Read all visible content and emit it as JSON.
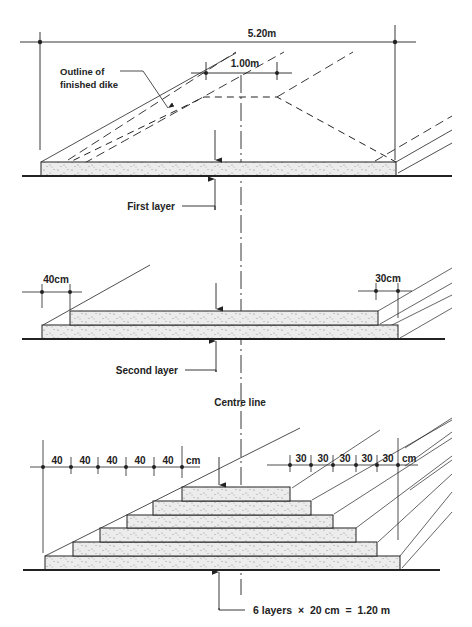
{
  "colors": {
    "ink": "#222222",
    "fill": "#e8e8e8",
    "dots": "#888888",
    "background": "#ffffff"
  },
  "section1": {
    "overall_width": "5.20m",
    "crest_width": "1.00m",
    "outline_label_line1": "Outline of",
    "outline_label_line2": "finished dike",
    "layer_label": "First layer"
  },
  "section2": {
    "left_offset": "40cm",
    "right_offset": "30cm",
    "layer_label": "Second layer"
  },
  "centre_line_label": "Centre line",
  "section3": {
    "left_steps": [
      "40",
      "40",
      "40",
      "40",
      "40"
    ],
    "left_unit": "cm",
    "right_steps": [
      "30",
      "30",
      "30",
      "30",
      "30"
    ],
    "right_unit": "cm",
    "total_label": "6 layers  ×  20 cm  =  1.20 m",
    "layers": 6,
    "layer_thickness_cm": 20,
    "total_height_m": 1.2
  }
}
